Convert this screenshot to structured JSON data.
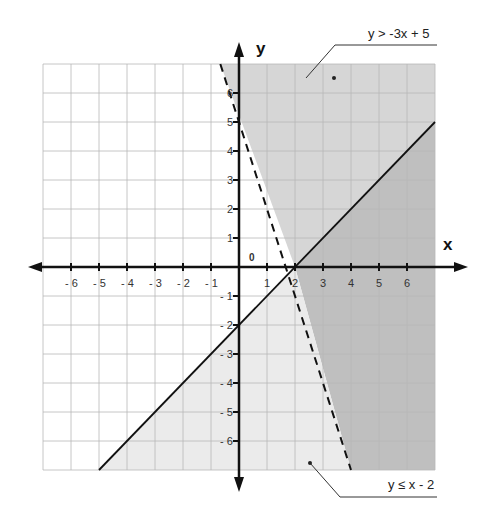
{
  "chart_data": {
    "type": "line",
    "title": "",
    "xlabel": "x",
    "ylabel": "y",
    "xlim": [
      -7,
      7
    ],
    "ylim": [
      -7,
      7
    ],
    "grid": true,
    "origin_label": "0",
    "x_ticks": [
      "- 6",
      "- 5",
      "- 4",
      "- 3",
      "- 2",
      "- 1",
      "1",
      "2",
      "3",
      "4",
      "5",
      "6"
    ],
    "x_tick_values": [
      -6,
      -5,
      -4,
      -3,
      -2,
      -1,
      1,
      2,
      3,
      4,
      5,
      6
    ],
    "y_ticks": [
      "6",
      "5",
      "4",
      "3",
      "2",
      "1",
      "- 1",
      "- 2",
      "- 3",
      "- 4",
      "- 5",
      "- 6"
    ],
    "y_tick_values": [
      6,
      5,
      4,
      3,
      2,
      1,
      -1,
      -2,
      -3,
      -4,
      -5,
      -6
    ],
    "series": [
      {
        "name": "y > -3x + 5",
        "boundary": "y = -3x + 5",
        "style": "dashed",
        "shading": "above",
        "points": [
          [
            -0.667,
            7
          ],
          [
            4,
            -7
          ]
        ]
      },
      {
        "name": "y ≤ x - 2",
        "boundary": "y = x - 2",
        "style": "solid",
        "shading": "below",
        "points": [
          [
            -5,
            -7
          ],
          [
            7,
            5
          ]
        ]
      }
    ],
    "annotations": [
      {
        "text": "y > -3x + 5",
        "points_to": [
          2.6,
          6.2
        ]
      },
      {
        "text": "y ≤ x - 2",
        "points_to": [
          1.6,
          -6.6
        ]
      }
    ],
    "colors": {
      "region_a_only": "#d6d6d6",
      "region_b_only": "#ebebeb",
      "overlap": "#bfbfbf",
      "grid": "#b8b8b8",
      "axis": "#111111"
    }
  }
}
